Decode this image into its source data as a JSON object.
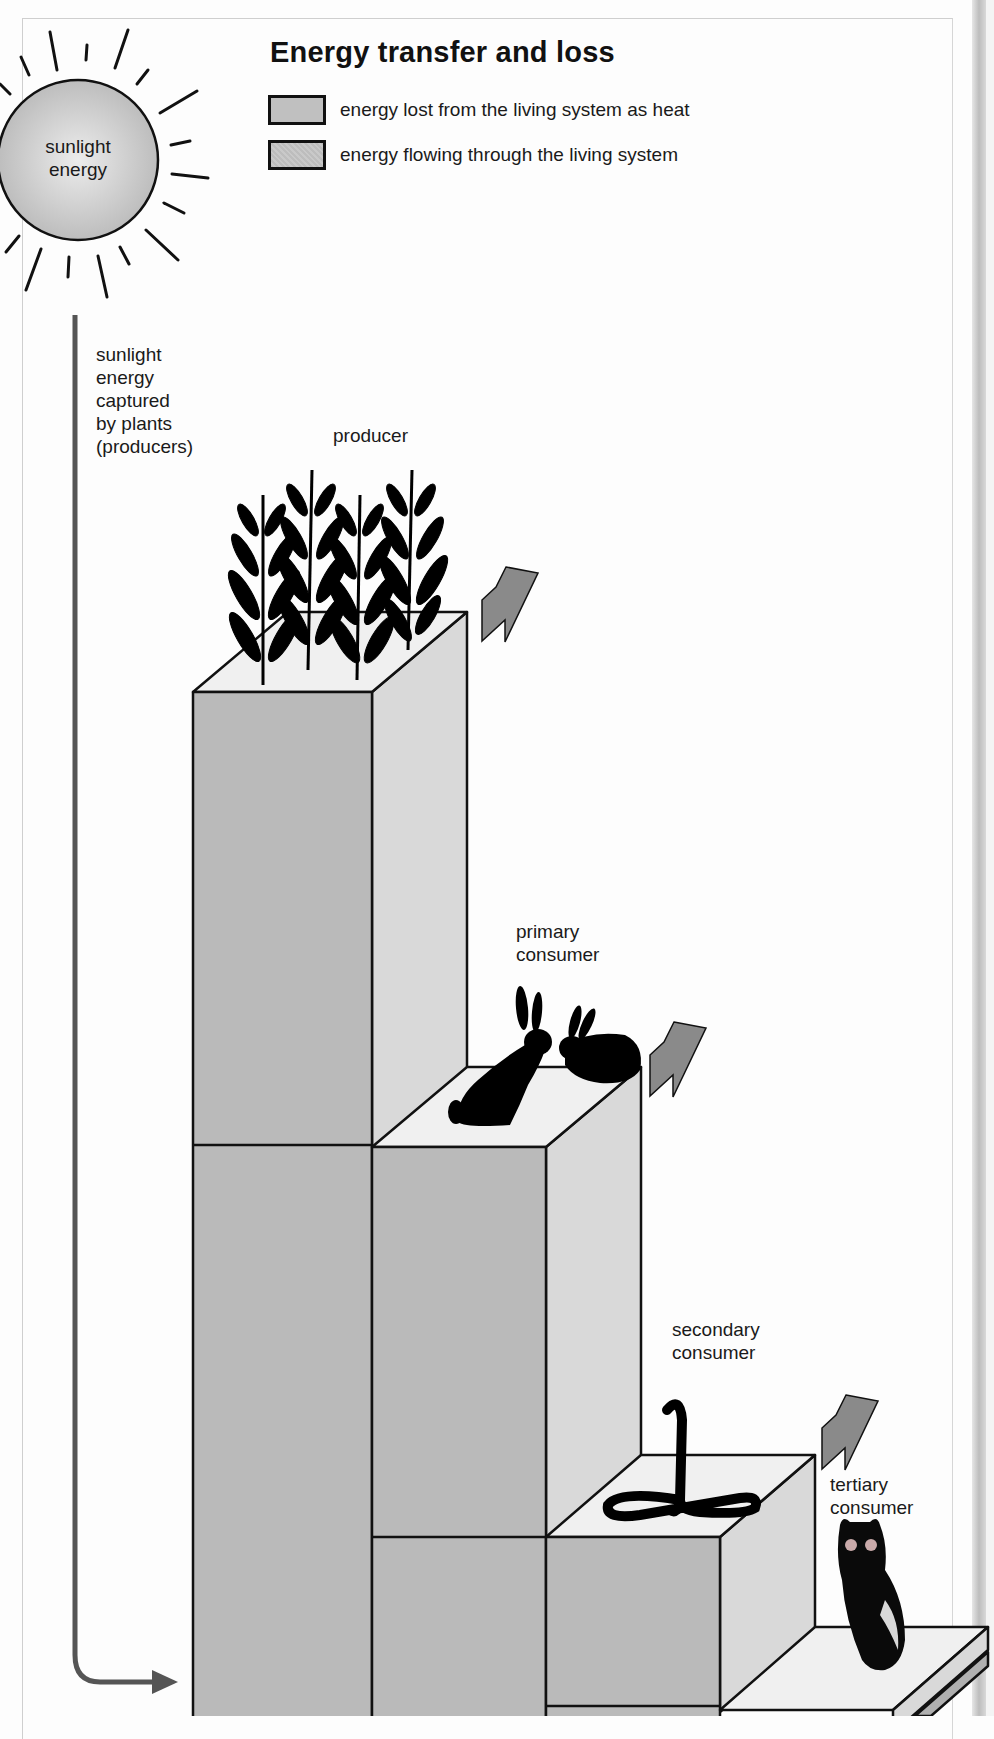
{
  "title": "Energy transfer and loss",
  "legend": [
    {
      "swatch": "solid-gray",
      "label": "energy lost from the living system as heat"
    },
    {
      "swatch": "hatched-gray",
      "label": "energy flowing through the living system"
    }
  ],
  "sun": {
    "label_line1": "sunlight",
    "label_line2": "energy"
  },
  "flow_label": [
    "sunlight",
    "energy",
    "captured",
    "by plants",
    "(producers)"
  ],
  "levels": [
    {
      "name": "producer",
      "label_lines": [
        "producer"
      ],
      "organism": "plants"
    },
    {
      "name": "primary consumer",
      "label_lines": [
        "primary",
        "consumer"
      ],
      "organism": "rabbits"
    },
    {
      "name": "secondary consumer",
      "label_lines": [
        "secondary",
        "consumer"
      ],
      "organism": "snake"
    },
    {
      "name": "tertiary consumer",
      "label_lines": [
        "tertiary",
        "consumer"
      ],
      "organism": "owl"
    }
  ],
  "colors": {
    "front_face": "#bababa",
    "side_face": "#d9d9d9",
    "top_face": "#f0f0f0",
    "heat_arrow": "#8a8a8a",
    "flow_arrow": "#555555",
    "outline": "#111111"
  }
}
